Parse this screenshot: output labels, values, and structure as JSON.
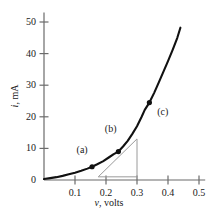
{
  "figure": {
    "background_color": "#ffffff",
    "curve_color": "#111111",
    "axis_color": "#6b6b6b",
    "triangle_color": "#9a9a9a",
    "text_color": "#1a1a1a"
  },
  "chart_data": {
    "type": "line",
    "title": "",
    "xlabel_var": "v",
    "xlabel_rest": ", volts",
    "ylabel_var": "i",
    "ylabel_rest": ", mA",
    "xlim": [
      0,
      0.52
    ],
    "ylim": [
      0,
      53
    ],
    "xticks": [
      0.1,
      0.2,
      0.3,
      0.4,
      0.5
    ],
    "xtick_labels": [
      "0.1",
      "0.2",
      "0.3",
      "0.4",
      "0.5"
    ],
    "yticks": [
      0,
      10,
      20,
      30,
      40,
      50
    ],
    "ytick_labels": [
      "0",
      "10",
      "20",
      "30",
      "40",
      "50"
    ],
    "grid": false,
    "legend": false,
    "origin_label": "0",
    "series": [
      {
        "name": "diode i-v characteristic",
        "x": [
          0.0,
          0.02,
          0.04,
          0.06,
          0.08,
          0.1,
          0.12,
          0.14,
          0.155,
          0.17,
          0.19,
          0.21,
          0.225,
          0.24,
          0.255,
          0.27,
          0.285,
          0.3,
          0.315,
          0.325,
          0.34,
          0.355,
          0.37,
          0.385,
          0.4,
          0.415,
          0.43,
          0.44
        ],
        "y": [
          0.3,
          0.6,
          0.9,
          1.3,
          1.8,
          2.3,
          2.9,
          3.6,
          4.2,
          4.9,
          5.9,
          7.2,
          8.2,
          9.0,
          10.6,
          12.4,
          14.6,
          17.0,
          20.0,
          22.2,
          24.5,
          27.5,
          30.8,
          34.2,
          37.6,
          41.2,
          45.0,
          48.2
        ]
      }
    ],
    "markers": [
      {
        "label": "(a)",
        "x": 0.155,
        "y": 4.2,
        "label_dx": -0.032,
        "label_dy": 5.2
      },
      {
        "label": "(b)",
        "x": 0.24,
        "y": 9.0,
        "label_dx": -0.025,
        "label_dy": 7.0
      },
      {
        "label": "(c)",
        "x": 0.34,
        "y": 24.5,
        "label_dx": 0.043,
        "label_dy": -3.0
      }
    ],
    "slope_triangle": {
      "description": "tangent slope construction at point (b)",
      "x_left": 0.175,
      "x_right": 0.3,
      "y_bottom": 1.0,
      "y_top": 13.0
    }
  }
}
